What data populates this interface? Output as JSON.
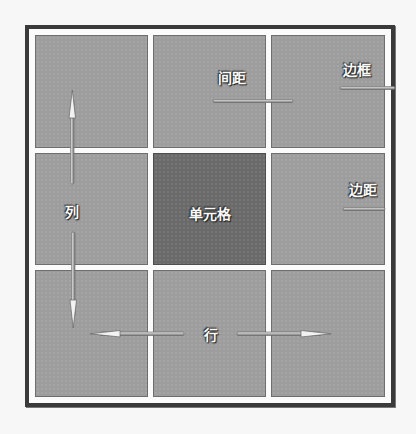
{
  "diagram": {
    "title": "",
    "grid": {
      "rows": 3,
      "columns": 3,
      "highlighted_cell": {
        "row": 2,
        "column": 2
      }
    },
    "labels": {
      "cell": "单元格",
      "column": "列",
      "row": "行",
      "spacing": "间距",
      "border": "边框",
      "padding": "边距"
    },
    "colors": {
      "background": "#f7f7f7",
      "frame": "#3a3a3a",
      "cell": "#9d9d9d",
      "highlighted_cell": "#6a6a6a",
      "label_text": "#fafafa"
    }
  }
}
